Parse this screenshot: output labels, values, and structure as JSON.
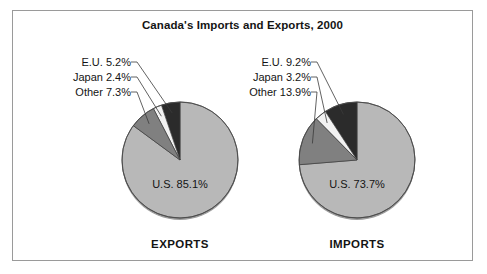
{
  "figure": {
    "title": "Canada's Imports and Exports, 2000",
    "border_color": "#9a9a9a",
    "background": "#ffffff"
  },
  "chart_data": {
    "type": "pie",
    "title": "Canada's Imports and Exports, 2000",
    "legend_position": "none",
    "charts": [
      {
        "caption": "EXPORTS",
        "center": [
          180,
          160
        ],
        "radius": 58,
        "inner_label": "U.S.  85.1%",
        "categories": [
          "U.S.",
          "E.U.",
          "Japan",
          "Other"
        ],
        "values": [
          85.1,
          5.2,
          2.4,
          7.3
        ],
        "colors": [
          "#b8b8b8",
          "#2b2b2b",
          "#f2f2f2",
          "#808080"
        ],
        "slices": [
          {
            "label": "U.S.",
            "value": 85.1,
            "text": "U.S.  85.1%",
            "color": "#b8b8b8",
            "callout": false
          },
          {
            "label": "E.U.",
            "value": 5.2,
            "text": "E.U.  5.2%",
            "color": "#2b2b2b",
            "callout": true
          },
          {
            "label": "Japan",
            "value": 2.4,
            "text": "Japan  2.4%",
            "color": "#f2f2f2",
            "callout": true
          },
          {
            "label": "Other",
            "value": 7.3,
            "text": "Other  7.3%",
            "color": "#808080",
            "callout": true
          }
        ],
        "callouts": [
          {
            "category": "E.U.",
            "percent": "5.2%"
          },
          {
            "category": "Japan",
            "percent": "2.4%"
          },
          {
            "category": "Other",
            "percent": "7.3%"
          }
        ]
      },
      {
        "caption": "IMPORTS",
        "center": [
          357,
          160
        ],
        "radius": 58,
        "inner_label": "U.S.  73.7%",
        "categories": [
          "U.S.",
          "E.U.",
          "Japan",
          "Other"
        ],
        "values": [
          73.7,
          9.2,
          3.2,
          13.9
        ],
        "colors": [
          "#b8b8b8",
          "#2b2b2b",
          "#f2f2f2",
          "#808080"
        ],
        "slices": [
          {
            "label": "U.S.",
            "value": 73.7,
            "text": "U.S.  73.7%",
            "color": "#b8b8b8",
            "callout": false
          },
          {
            "label": "E.U.",
            "value": 9.2,
            "text": "E.U.  9.2%",
            "color": "#2b2b2b",
            "callout": true
          },
          {
            "label": "Japan",
            "value": 3.2,
            "text": "Japan  3.2%",
            "color": "#f2f2f2",
            "callout": true
          },
          {
            "label": "Other",
            "value": 13.9,
            "text": "Other  13.9%",
            "color": "#808080",
            "callout": true
          }
        ],
        "callouts": [
          {
            "category": "E.U.",
            "percent": "9.2%"
          },
          {
            "category": "Japan",
            "percent": "3.2%"
          },
          {
            "category": "Other",
            "percent": "13.9%"
          }
        ]
      }
    ]
  },
  "labels": {
    "exports": {
      "eu": "E.U.  5.2%",
      "japan": "Japan  2.4%",
      "other": "Other  7.3%",
      "us": "U.S.  85.1%",
      "caption": "EXPORTS"
    },
    "imports": {
      "eu": "E.U.  9.2%",
      "japan": "Japan  3.2%",
      "other": "Other  13.9%",
      "us": "U.S.  73.7%",
      "caption": "IMPORTS"
    }
  }
}
